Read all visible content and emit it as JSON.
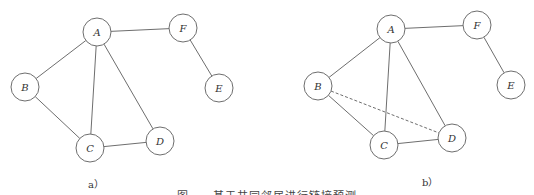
{
  "figure": {
    "caption": "图　　基于共同邻居进行链接预测",
    "node_radius": 14,
    "stroke_color": "#6e6e6e",
    "panels": [
      {
        "id": "a",
        "label": "a）",
        "label_pos": [
          88,
          176
        ],
        "nodes": [
          {
            "id": "A",
            "x": 97,
            "y": 32
          },
          {
            "id": "F",
            "x": 183,
            "y": 28
          },
          {
            "id": "B",
            "x": 25,
            "y": 87
          },
          {
            "id": "E",
            "x": 219,
            "y": 88
          },
          {
            "id": "C",
            "x": 90,
            "y": 148
          },
          {
            "id": "D",
            "x": 160,
            "y": 141
          }
        ],
        "edges": [
          {
            "from": "A",
            "to": "F",
            "style": "solid"
          },
          {
            "from": "F",
            "to": "E",
            "style": "solid"
          },
          {
            "from": "A",
            "to": "B",
            "style": "solid"
          },
          {
            "from": "A",
            "to": "C",
            "style": "solid"
          },
          {
            "from": "A",
            "to": "D",
            "style": "solid"
          },
          {
            "from": "B",
            "to": "C",
            "style": "solid"
          },
          {
            "from": "C",
            "to": "D",
            "style": "solid"
          }
        ]
      },
      {
        "id": "b",
        "label": "b）",
        "label_pos": [
          422,
          174
        ],
        "nodes": [
          {
            "id": "A",
            "x": 391,
            "y": 29
          },
          {
            "id": "F",
            "x": 477,
            "y": 25
          },
          {
            "id": "B",
            "x": 318,
            "y": 86
          },
          {
            "id": "E",
            "x": 511,
            "y": 85
          },
          {
            "id": "C",
            "x": 384,
            "y": 145
          },
          {
            "id": "D",
            "x": 452,
            "y": 138
          }
        ],
        "edges": [
          {
            "from": "A",
            "to": "F",
            "style": "solid"
          },
          {
            "from": "F",
            "to": "E",
            "style": "solid"
          },
          {
            "from": "A",
            "to": "B",
            "style": "solid"
          },
          {
            "from": "A",
            "to": "C",
            "style": "solid"
          },
          {
            "from": "A",
            "to": "D",
            "style": "solid"
          },
          {
            "from": "B",
            "to": "C",
            "style": "solid"
          },
          {
            "from": "C",
            "to": "D",
            "style": "solid"
          },
          {
            "from": "B",
            "to": "D",
            "style": "dashed"
          }
        ]
      }
    ]
  }
}
